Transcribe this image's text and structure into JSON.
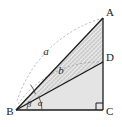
{
  "figure": {
    "kind": "geometry-diagram",
    "background_color": "#ffffff"
  },
  "colors": {
    "stroke": "#1c1c1c",
    "thin_stroke": "#3c3c3c",
    "dashed_arc": "#9a9a9a",
    "upper_fill": "#cfcfcf",
    "lower_fill": "#e4e4e4",
    "hatch": "#ffffff",
    "label_text": "#1a1a1a"
  },
  "points": {
    "A": {
      "label": "A",
      "x": 103,
      "y": 18,
      "label_x": 108,
      "label_y": 13
    },
    "B": {
      "label": "B",
      "x": 16,
      "y": 110,
      "label_x": 9,
      "label_y": 114
    },
    "C": {
      "label": "C",
      "x": 103,
      "y": 110,
      "label_x": 108,
      "label_y": 114
    },
    "D": {
      "label": "D",
      "x": 103,
      "y": 62,
      "label_x": 108,
      "label_y": 58
    }
  },
  "segments": [
    {
      "name": "BC",
      "from": "B",
      "to": "C",
      "style": "solid"
    },
    {
      "name": "CA",
      "from": "C",
      "to": "A",
      "style": "solid"
    },
    {
      "name": "AB",
      "from": "A",
      "to": "B",
      "style": "solid"
    },
    {
      "name": "BD",
      "from": "B",
      "to": "D",
      "style": "solid"
    }
  ],
  "arcs": [
    {
      "name": "arc-a",
      "label": "a",
      "from": "A",
      "to": "BC-line",
      "style": "dashed",
      "label_x": 46,
      "label_y": 53
    },
    {
      "name": "arc-b",
      "label": "b",
      "from": "D",
      "to": "BC-line",
      "style": "dashed",
      "label_x": 60,
      "label_y": 71
    }
  ],
  "angles": [
    {
      "name": "alpha",
      "label": "α",
      "vertex": "B",
      "between": "BC and BD",
      "label_x": 38,
      "label_y": 105
    },
    {
      "name": "beta",
      "label": "β",
      "vertex": "B",
      "between": "BD and BA",
      "label_x": 27,
      "label_y": 106
    }
  ],
  "markers": [
    {
      "name": "right-angle-C",
      "vertex": "C",
      "symbol": "square",
      "size": 7
    }
  ]
}
